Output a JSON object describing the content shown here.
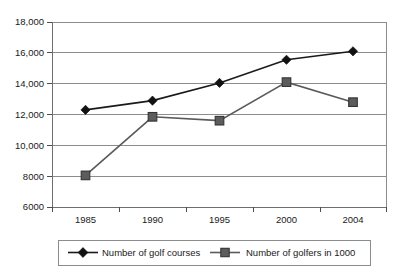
{
  "chart_data": {
    "type": "line",
    "title": "",
    "subtitle": "",
    "xlabel": "",
    "ylabel": "",
    "categories": [
      "1985",
      "1990",
      "1995",
      "2000",
      "2004"
    ],
    "x_tick_labels": [
      "1985",
      "1990",
      "1995",
      "2000",
      "2004"
    ],
    "y_tick_labels": [
      "18,000",
      "16,000",
      "14,000",
      "12,000",
      "10,000",
      "8000",
      "6000"
    ],
    "y_tick_values": [
      18000,
      16000,
      14000,
      12000,
      10000,
      8000,
      6000
    ],
    "ylim": [
      6000,
      18000
    ],
    "grid": "horizontal",
    "legend_position": "bottom",
    "series": [
      {
        "name": "Number of golf courses",
        "marker": "diamond",
        "color": "#111111",
        "values": [
          12300,
          12900,
          14050,
          15550,
          16100
        ]
      },
      {
        "name": "Number of golfers in 1000",
        "marker": "square",
        "color": "#5c5c5c",
        "values": [
          8050,
          11850,
          11600,
          14100,
          12800
        ]
      }
    ]
  },
  "legend": {
    "items": [
      {
        "label": "Number of golf courses",
        "marker": "diamond-marker-icon"
      },
      {
        "label": "Number of golfers in 1000",
        "marker": "square-marker-icon"
      }
    ]
  }
}
